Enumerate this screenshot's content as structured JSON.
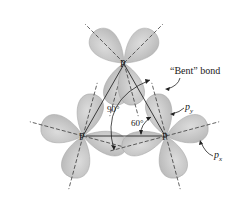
{
  "figure": {
    "molecule": "P4",
    "atoms": [
      {
        "id": "top",
        "label": "P"
      },
      {
        "id": "left",
        "label": "P"
      },
      {
        "id": "right",
        "label": "P"
      }
    ],
    "angles": {
      "orbital_angle": "90°",
      "bond_angle": "60°"
    },
    "callouts": {
      "bent_bond": "“Bent” bond",
      "py_main": "p",
      "py_sub": "y",
      "px_main": "p",
      "px_sub": "x"
    },
    "colors": {
      "lobe_fill": "#c4c4c4",
      "lobe_edge": "#a6a6a6",
      "bond_line": "#3a3a3a",
      "axis_dash": "#333333",
      "background": "#ffffff"
    }
  }
}
